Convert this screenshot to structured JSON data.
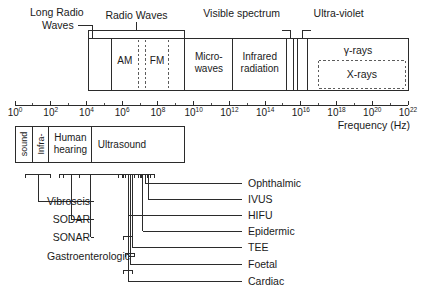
{
  "figure": {
    "axis": {
      "label": "Frequency (Hz)",
      "base": "10",
      "exponents": [
        "0",
        "2",
        "4",
        "6",
        "8",
        "10",
        "12",
        "14",
        "16",
        "18",
        "20",
        "22"
      ],
      "tick_labels": [
        "10^0",
        "10^2",
        "10^4",
        "10^6",
        "10^8",
        "10^10",
        "10^12",
        "10^14",
        "10^16",
        "10^18",
        "10^20",
        "10^22"
      ],
      "range_decades": [
        0,
        22
      ],
      "minor_ticks_per_label": 1
    },
    "em_bands": [
      {
        "name": "Long Radio Waves",
        "label": "Long Radio\nWaves",
        "line1": "Long Radio",
        "line2": "Waves",
        "placement": "callout-top-left",
        "start_decade": 4.1,
        "end_decade": 5.4
      },
      {
        "name": "Radio Waves",
        "label": "Radio Waves",
        "placement": "bracket-top",
        "start_decade": 4.1,
        "end_decade": 9.5
      },
      {
        "name": "AM",
        "label": "AM",
        "placement": "inside-dashed",
        "start_decade": 5.4,
        "end_decade": 6.9
      },
      {
        "name": "FM",
        "label": "FM",
        "placement": "inside-dashed",
        "start_decade": 7.3,
        "end_decade": 8.6
      },
      {
        "name": "Micro-waves",
        "line1": "Micro-",
        "line2": "waves",
        "placement": "inside",
        "start_decade": 9.5,
        "end_decade": 12.2
      },
      {
        "name": "Infrared radiation",
        "line1": "Infrared",
        "line2": "radiation",
        "placement": "inside",
        "start_decade": 12.2,
        "end_decade": 15.2
      },
      {
        "name": "Visible spectrum",
        "label": "Visible spectrum",
        "placement": "callout-top",
        "start_decade": 15.2,
        "end_decade": 15.6
      },
      {
        "name": "Ultra-violet",
        "label": "Ultra-violet",
        "placement": "callout-top",
        "start_decade": 15.8,
        "end_decade": 16.4
      },
      {
        "name": "gamma-rays",
        "label": "γ-rays",
        "placement": "inside-upper",
        "start_decade": 16.4,
        "end_decade": 22.0
      },
      {
        "name": "X-rays",
        "label": "X-rays",
        "placement": "inside-dashed-lower",
        "start_decade": 17.0,
        "end_decade": 22.0
      }
    ],
    "acoustic_bands": [
      {
        "name": "sound",
        "label": "sound",
        "orientation": "vertical",
        "start_decade": 0.0,
        "end_decade": 1.0
      },
      {
        "name": "Infra-",
        "label": "Infra-",
        "orientation": "vertical",
        "start_decade": 1.0,
        "end_decade": 1.9
      },
      {
        "name": "Human hearing",
        "line1": "Human",
        "line2": "hearing",
        "orientation": "horizontal",
        "start_decade": 1.9,
        "end_decade": 4.3
      },
      {
        "name": "Ultrasound",
        "label": "Ultrasound",
        "orientation": "horizontal",
        "start_decade": 4.3,
        "end_decade": 9.5
      }
    ],
    "applications_left": [
      {
        "name": "Vibroseis",
        "label": "Vibroseis",
        "start_decade": 0.6,
        "end_decade": 2.0
      },
      {
        "name": "SODAR",
        "label": "SODAR",
        "start_decade": 2.7,
        "end_decade": 3.6
      },
      {
        "name": "SONAR",
        "label": "SONAR",
        "start_decade": 2.5,
        "end_decade": 6.0
      },
      {
        "name": "Gastroenterologic",
        "label": "Gastroenterologic",
        "start_decade": 5.8,
        "end_decade": 6.9
      }
    ],
    "applications_right": [
      {
        "name": "Ophthalmic",
        "label": "Ophthalmic",
        "start_decade": 7.0,
        "end_decade": 7.6
      },
      {
        "name": "IVUS",
        "label": "IVUS",
        "start_decade": 7.1,
        "end_decade": 7.8
      },
      {
        "name": "HIFU",
        "label": "HIFU",
        "start_decade": 6.1,
        "end_decade": 6.6
      },
      {
        "name": "Epidermic",
        "label": "Epidermic",
        "start_decade": 6.9,
        "end_decade": 7.4
      },
      {
        "name": "TEE",
        "label": "TEE",
        "start_decade": 6.2,
        "end_decade": 6.9
      },
      {
        "name": "Foetal",
        "label": "Foetal",
        "start_decade": 6.2,
        "end_decade": 6.7
      },
      {
        "name": "Cardiac",
        "label": "Cardiac",
        "start_decade": 6.1,
        "end_decade": 6.6
      }
    ],
    "colors": {
      "line": "#2b2b2b",
      "text": "#1a1a1a",
      "background": "#ffffff",
      "dashed": "#4a4a4a"
    }
  },
  "chart_data": {
    "type": "table",
    "xlabel": "Frequency (Hz)",
    "ylabel": "",
    "xlim": [
      0,
      22
    ],
    "x_scale": "log10",
    "grid": false,
    "legend": "none",
    "categories": [
      "Long Radio Waves",
      "Radio Waves",
      "AM",
      "FM",
      "Micro-waves",
      "Infrared radiation",
      "Visible spectrum",
      "Ultra-violet",
      "γ-rays",
      "X-rays",
      "sound",
      "Infra-",
      "Human hearing",
      "Ultrasound",
      "Vibroseis",
      "SODAR",
      "SONAR",
      "Gastroenterologic",
      "Ophthalmic",
      "IVUS",
      "HIFU",
      "Epidermic",
      "TEE",
      "Foetal",
      "Cardiac"
    ],
    "series": [
      {
        "name": "start_decade",
        "values": [
          4.1,
          4.1,
          5.4,
          7.3,
          9.5,
          12.2,
          15.2,
          15.8,
          16.4,
          17.0,
          0.0,
          1.0,
          1.9,
          4.3,
          0.6,
          2.7,
          2.5,
          5.8,
          7.0,
          7.1,
          6.1,
          6.9,
          6.2,
          6.2,
          6.1
        ]
      },
      {
        "name": "end_decade",
        "values": [
          5.4,
          9.5,
          6.9,
          8.6,
          12.2,
          15.2,
          15.6,
          16.4,
          22.0,
          22.0,
          1.0,
          1.9,
          4.3,
          9.5,
          2.0,
          3.6,
          6.0,
          6.9,
          7.6,
          7.8,
          6.6,
          7.4,
          6.9,
          6.7,
          6.6
        ]
      }
    ],
    "tick_labels": [
      "10^0",
      "10^2",
      "10^4",
      "10^6",
      "10^8",
      "10^10",
      "10^12",
      "10^14",
      "10^16",
      "10^18",
      "10^20",
      "10^22"
    ]
  }
}
